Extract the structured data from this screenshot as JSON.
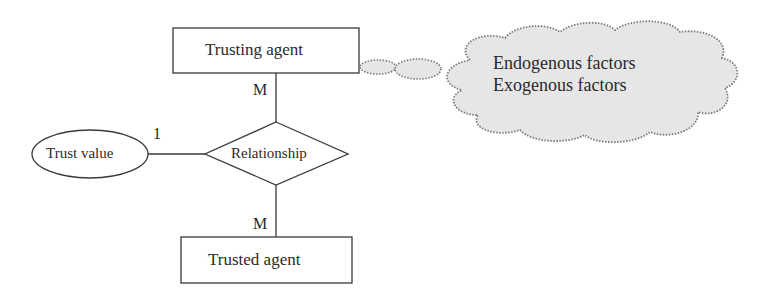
{
  "diagram": {
    "type": "entity-relationship",
    "entities": [
      {
        "id": "trusting",
        "label": "Trusting agent"
      },
      {
        "id": "trusted",
        "label": "Trusted agent"
      }
    ],
    "relationship": {
      "label": "Relationship"
    },
    "attribute": {
      "label": "Trust value"
    },
    "cardinalities": {
      "trusting": "M",
      "trusted": "M",
      "trust_value": "1"
    },
    "annotation": {
      "shape": "cloud",
      "lines": [
        "Endogenous factors",
        "Exogenous factors"
      ],
      "attached_to": "Trusting agent"
    },
    "colors": {
      "stroke": "#3a3a3a",
      "cloud_fill": "#e6e6e6",
      "cloud_stroke": "#7a7a7a"
    }
  }
}
